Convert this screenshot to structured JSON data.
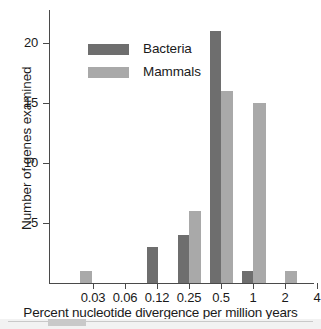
{
  "chart_data": {
    "type": "bar",
    "title": "",
    "subtitle": "",
    "xlabel": "Percent nucleotide divergence per million years",
    "ylabel": "Number of genes examined",
    "xscale": "log",
    "xticks": [
      "0.03",
      "0.06",
      "0.12",
      "0.25",
      "0.5",
      "1",
      "2",
      "4"
    ],
    "xtick_positions": [
      93,
      125,
      157,
      189,
      221,
      253,
      285,
      317
    ],
    "yticks": [
      "5",
      "10",
      "15",
      "20"
    ],
    "ytick_values": [
      5,
      10,
      15,
      20
    ],
    "ylim": [
      0,
      22
    ],
    "grid": false,
    "legend_position": "upper-left-inside",
    "categories": [
      "0.03-0.06",
      "0.06-0.12",
      "0.12-0.25",
      "0.25-0.5",
      "0.5-1",
      "1-2",
      "2-4"
    ],
    "series": [
      {
        "name": "Bacteria",
        "color": "#6e6e6e",
        "values": [
          0,
          0,
          3,
          4,
          21,
          1,
          0
        ]
      },
      {
        "name": "Mammals",
        "color": "#a9a9a9",
        "values": [
          1,
          0,
          0,
          6,
          16,
          15,
          1
        ]
      }
    ],
    "bars": [
      {
        "series": "Bacteria",
        "bin": "0.12-0.25",
        "value": 3,
        "left": 147,
        "width": 11,
        "color": "#6e6e6e"
      },
      {
        "series": "Mammals",
        "bin": "0.03-0.06",
        "value": 1,
        "left": 80,
        "width": 12,
        "color": "#a9a9a9"
      },
      {
        "series": "Bacteria",
        "bin": "0.25-0.5",
        "value": 4,
        "left": 178,
        "width": 11,
        "color": "#6e6e6e"
      },
      {
        "series": "Mammals",
        "bin": "0.25-0.5",
        "value": 6,
        "left": 189,
        "width": 12,
        "color": "#a9a9a9"
      },
      {
        "series": "Bacteria",
        "bin": "0.5-1",
        "value": 21,
        "left": 210,
        "width": 11,
        "color": "#6e6e6e"
      },
      {
        "series": "Mammals",
        "bin": "0.5-1",
        "value": 16,
        "left": 221,
        "width": 12,
        "color": "#a9a9a9"
      },
      {
        "series": "Bacteria",
        "bin": "1-2",
        "value": 1,
        "left": 242,
        "width": 11,
        "color": "#6e6e6e"
      },
      {
        "series": "Mammals",
        "bin": "1-2",
        "value": 15,
        "left": 253,
        "width": 13,
        "color": "#a9a9a9"
      },
      {
        "series": "Mammals",
        "bin": "2-4",
        "value": 1,
        "left": 285,
        "width": 12,
        "color": "#a9a9a9"
      }
    ]
  },
  "legend": {
    "items": [
      {
        "label": "Bacteria",
        "color": "#6e6e6e"
      },
      {
        "label": "Mammals",
        "color": "#a9a9a9"
      }
    ]
  },
  "colors": {
    "bacteria": "#6e6e6e",
    "mammals": "#a9a9a9",
    "axis": "#4a4a4a",
    "text": "#1a1a1a",
    "background": "#ffffff",
    "scan_strip": "#c9c9c9"
  }
}
